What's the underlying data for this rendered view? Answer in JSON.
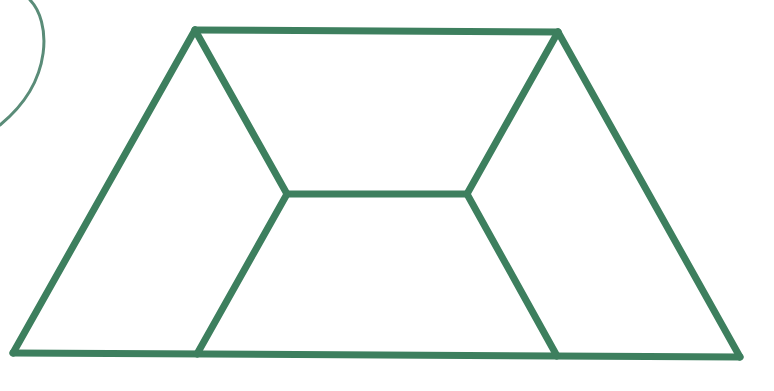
{
  "diagram": {
    "type": "geometric-figure",
    "colors": {
      "stroke": "#3d7f5e",
      "arc": "#5a8c78",
      "background": "#ffffff"
    },
    "stroke_width": 7,
    "arc_stroke_width": 3,
    "vertices": {
      "A_top_left": [
        195,
        30
      ],
      "B_top_right": [
        558,
        32
      ],
      "C_bottom_right": [
        740,
        357
      ],
      "D_bottom_left": [
        13,
        353
      ],
      "E_inner_left": [
        287,
        194
      ],
      "F_inner_right": [
        467,
        194
      ],
      "G_bottom_inner_left": [
        197,
        354
      ],
      "H_bottom_inner_right": [
        557,
        356
      ]
    },
    "edges": [
      {
        "id": "top",
        "from": "A_top_left",
        "to": "B_top_right"
      },
      {
        "id": "right-side",
        "from": "B_top_right",
        "to": "C_bottom_right"
      },
      {
        "id": "bottom",
        "from": "C_bottom_right",
        "to": "D_bottom_left"
      },
      {
        "id": "left-side",
        "from": "D_bottom_left",
        "to": "A_top_left"
      },
      {
        "id": "inner-top-left",
        "from": "A_top_left",
        "to": "E_inner_left"
      },
      {
        "id": "inner-middle",
        "from": "E_inner_left",
        "to": "F_inner_right"
      },
      {
        "id": "inner-top-right",
        "from": "F_inner_right",
        "to": "B_top_right"
      },
      {
        "id": "inner-bottom-left",
        "from": "E_inner_left",
        "to": "G_bottom_inner_left"
      },
      {
        "id": "inner-bottom-right",
        "from": "F_inner_right",
        "to": "H_bottom_inner_right"
      }
    ],
    "arc": {
      "path": "M 30 0 C 50 20, 55 80, 0 125"
    },
    "labels": []
  }
}
